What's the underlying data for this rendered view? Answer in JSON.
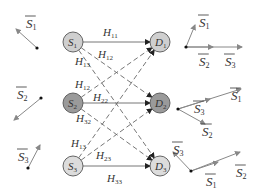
{
  "diagram": {
    "title": "",
    "sources": [
      {
        "id": "S1",
        "letter": "S",
        "sub": "1",
        "x": 73,
        "y": 42,
        "fill": "#cfcfcf"
      },
      {
        "id": "S2",
        "letter": "S",
        "sub": "2",
        "x": 73,
        "y": 103,
        "fill": "#9a9a9a"
      },
      {
        "id": "S3",
        "letter": "S",
        "sub": "3",
        "x": 73,
        "y": 166,
        "fill": "#dcdcdc"
      }
    ],
    "destinations": [
      {
        "id": "D1",
        "letter": "D",
        "sub": "1",
        "x": 160,
        "y": 42,
        "fill": "#cfcfcf"
      },
      {
        "id": "D2",
        "letter": "D",
        "sub": "2",
        "x": 160,
        "y": 103,
        "fill": "#9a9a9a"
      },
      {
        "id": "D3",
        "letter": "D",
        "sub": "3",
        "x": 160,
        "y": 166,
        "fill": "#dcdcdc"
      }
    ],
    "channels": [
      {
        "label": "H",
        "sub": "11",
        "style": "solid",
        "from": "S1",
        "to": "D1",
        "lx": 103,
        "ly": 36
      },
      {
        "label": "H",
        "sub": "12",
        "style": "dashed",
        "from": "S1",
        "to": "D2",
        "lx": 98,
        "ly": 58
      },
      {
        "label": "H",
        "sub": "13",
        "style": "dashed",
        "from": "S1",
        "to": "D3",
        "lx": 75,
        "ly": 65
      },
      {
        "label": "H",
        "sub": "12",
        "style": "dashed",
        "from": "S2",
        "to": "D1",
        "lx": 75,
        "ly": 88
      },
      {
        "label": "H",
        "sub": "22",
        "style": "solid",
        "from": "S2",
        "to": "D2",
        "lx": 93,
        "ly": 101
      },
      {
        "label": "H",
        "sub": "32",
        "style": "dashed",
        "from": "S2",
        "to": "D3",
        "lx": 76,
        "ly": 122
      },
      {
        "label": "H",
        "sub": "13",
        "style": "dashed",
        "from": "S3",
        "to": "D1",
        "lx": 71,
        "ly": 147
      },
      {
        "label": "H",
        "sub": "23",
        "style": "dashed",
        "from": "S3",
        "to": "D2",
        "lx": 96,
        "ly": 159
      },
      {
        "label": "H",
        "sub": "33",
        "style": "solid",
        "from": "S3",
        "to": "D3",
        "lx": 107,
        "ly": 182
      }
    ],
    "left_vectors": [
      {
        "label": "S",
        "sub": "1",
        "origin": [
          37,
          48
        ],
        "tip": [
          16,
          29
        ],
        "lx": 26,
        "ly": 28
      },
      {
        "label": "S",
        "sub": "2",
        "origin": [
          41,
          98
        ],
        "tip": [
          14,
          120
        ],
        "lx": 17,
        "ly": 99
      },
      {
        "label": "S",
        "sub": "3",
        "origin": [
          28,
          168
        ],
        "tip": [
          40,
          145
        ],
        "lx": 18,
        "ly": 161
      }
    ],
    "right_diagrams": [
      {
        "origin": [
          186,
          47
        ],
        "vectors": [
          {
            "label": "S",
            "sub": "1",
            "tip": [
              195,
              25
            ],
            "lx": 199,
            "ly": 27
          },
          {
            "label": "S",
            "sub": "2",
            "tip": [
              213,
              47
            ],
            "lx": 199,
            "ly": 66
          },
          {
            "label": "S",
            "sub": "3",
            "tip": [
              242,
              47
            ],
            "lx": 225,
            "ly": 66
          }
        ]
      },
      {
        "origin": [
          178,
          109
        ],
        "vectors": [
          {
            "label": "S",
            "sub": "1",
            "tip": [
              241,
              89
            ],
            "lx": 231,
            "ly": 100
          },
          {
            "label": "S",
            "sub": "3",
            "tip": [
              210,
              99
            ],
            "lx": 194,
            "ly": 113
          },
          {
            "label": "S",
            "sub": "2",
            "tip": [
              205,
              124
            ],
            "lx": 202,
            "ly": 136
          }
        ]
      },
      {
        "origin": [
          191,
          171
        ],
        "vectors": [
          {
            "label": "S",
            "sub": "3",
            "tip": [
              173,
              152
            ],
            "lx": 173,
            "ly": 154
          },
          {
            "label": "S",
            "sub": "1",
            "tip": [
              218,
              162
            ],
            "lx": 206,
            "ly": 186
          },
          {
            "label": "S",
            "sub": "2",
            "tip": [
              240,
              152
            ],
            "lx": 236,
            "ly": 177
          }
        ]
      }
    ],
    "colors": {
      "line": "#666666",
      "arrow": "#888888",
      "text": "#333333",
      "dot": "#111111"
    }
  }
}
